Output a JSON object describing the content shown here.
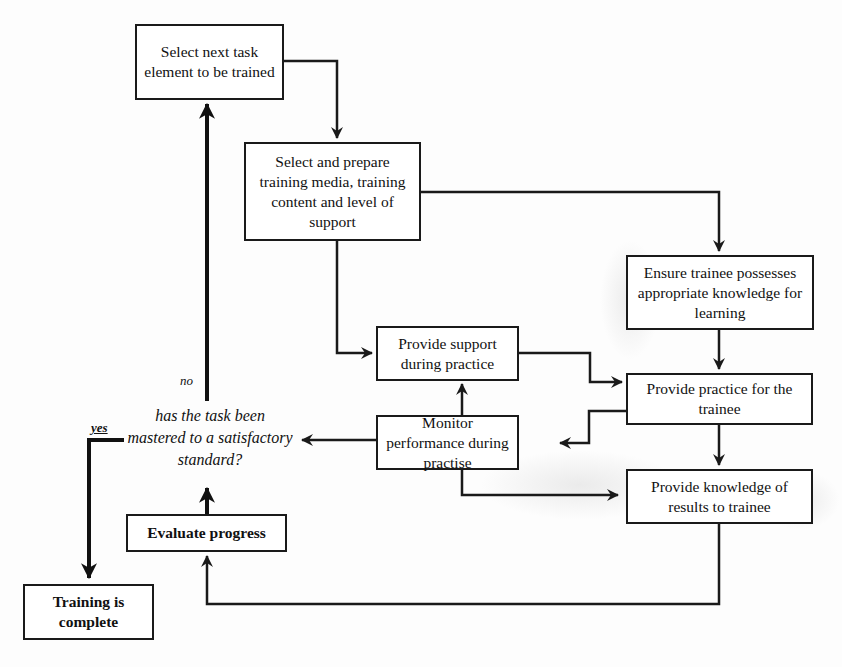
{
  "diagram": {
    "type": "flowchart",
    "nodes": {
      "select_next": {
        "label": "Select next task element to be trained"
      },
      "select_prepare": {
        "label": "Select and prepare training media, training content and level of support"
      },
      "ensure_knowledge": {
        "label": "Ensure trainee possesses appropriate knowledge for learning"
      },
      "provide_support": {
        "label": "Provide support during practice"
      },
      "provide_practice": {
        "label": "Provide practice for the trainee"
      },
      "monitor": {
        "label": "Monitor performance during practise"
      },
      "provide_kor": {
        "label": "Provide knowledge of results to trainee"
      },
      "evaluate": {
        "label": "Evaluate progress"
      },
      "complete": {
        "label": "Training is complete"
      },
      "decision": {
        "label": "has the task been mastered to a satisfactory standard?"
      }
    },
    "edge_labels": {
      "no": "no",
      "yes": "yes"
    },
    "edges": [
      [
        "select_next",
        "select_prepare"
      ],
      [
        "select_prepare",
        "ensure_knowledge"
      ],
      [
        "select_prepare",
        "provide_support"
      ],
      [
        "ensure_knowledge",
        "provide_practice"
      ],
      [
        "provide_support",
        "provide_practice"
      ],
      [
        "provide_practice",
        "monitor"
      ],
      [
        "provide_practice",
        "provide_kor"
      ],
      [
        "monitor",
        "provide_support"
      ],
      [
        "monitor",
        "decision"
      ],
      [
        "monitor",
        "provide_kor"
      ],
      [
        "provide_kor",
        "evaluate"
      ],
      [
        "evaluate",
        "decision"
      ],
      [
        "decision",
        "select_next",
        "no"
      ],
      [
        "decision",
        "complete",
        "yes"
      ]
    ]
  }
}
